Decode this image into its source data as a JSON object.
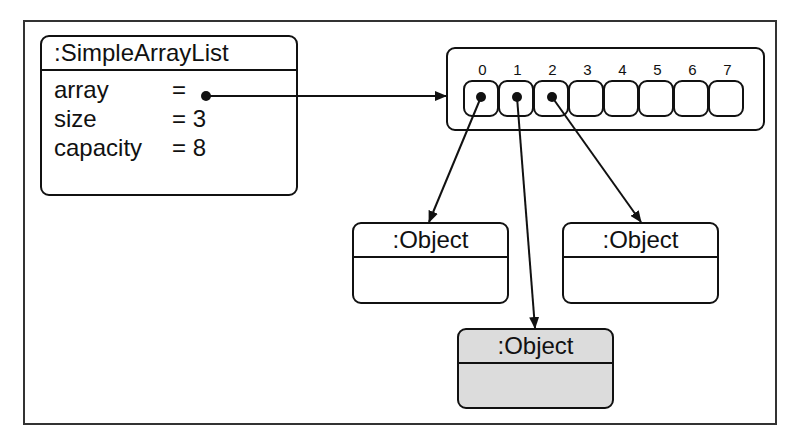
{
  "diagram": {
    "type": "object-diagram",
    "list_object": {
      "title": ":SimpleArrayList",
      "attributes": [
        {
          "name": "array",
          "eq": "=",
          "value": "•"
        },
        {
          "name": "size",
          "eq": "=",
          "value": "3"
        },
        {
          "name": "capacity",
          "eq": "=",
          "value": "8"
        }
      ]
    },
    "array": {
      "indices": [
        "0",
        "1",
        "2",
        "3",
        "4",
        "5",
        "6",
        "7"
      ],
      "filled_cells": [
        0,
        1,
        2
      ]
    },
    "objects": [
      {
        "title": ":Object",
        "highlighted": false
      },
      {
        "title": ":Object",
        "highlighted": false
      },
      {
        "title": ":Object",
        "highlighted": true
      }
    ],
    "colors": {
      "stroke": "#111111",
      "highlight_fill": "#dcdcdc",
      "background": "#ffffff"
    }
  }
}
